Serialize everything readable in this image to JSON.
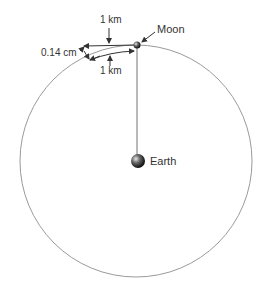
{
  "diagram": {
    "labels": {
      "moon": "Moon",
      "earth": "Earth",
      "top_distance": "1 km",
      "bottom_distance": "1 km",
      "fall_distance": "0.14 cm"
    },
    "colors": {
      "orbit": "#9a9a9a",
      "arrow": "#333333",
      "radius_line": "#8a8a8a",
      "text": "#333333"
    }
  }
}
